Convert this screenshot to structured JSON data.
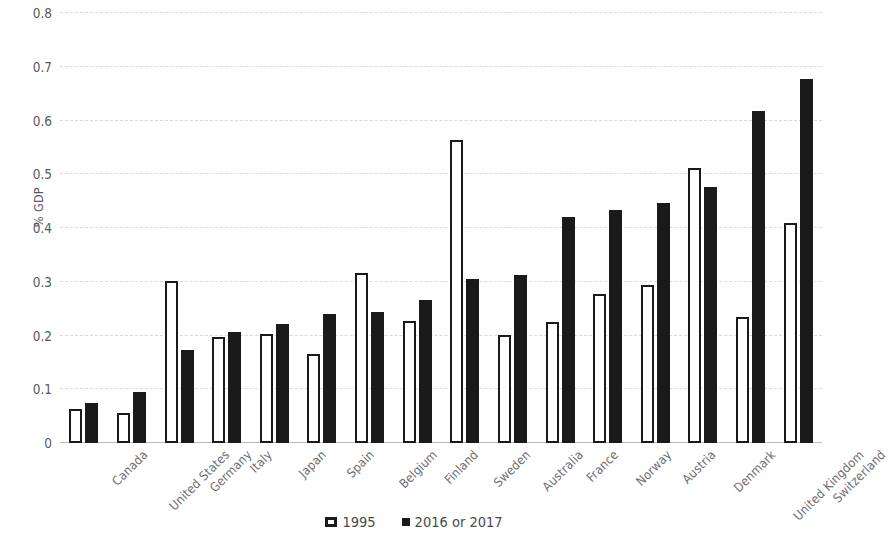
{
  "chart_data": {
    "type": "bar",
    "title": "",
    "xlabel": "",
    "ylabel": "% GDP",
    "ylim": [
      0,
      0.8
    ],
    "ytick_values": [
      0,
      0.1,
      0.2,
      0.3,
      0.4,
      0.5,
      0.6,
      0.7,
      0.8
    ],
    "ytick_labels": [
      "0",
      "0.1",
      "0.2",
      "0.3",
      "0.4",
      "0.5",
      "0.6",
      "0.7",
      "0.8"
    ],
    "grid": true,
    "legend_position": "bottom-center",
    "categories": [
      "Canada",
      "United States",
      "Germany",
      "Italy",
      "Japan",
      "Spain",
      "Belgium",
      "Finland",
      "Sweden",
      "Australia",
      "France",
      "Norway",
      "Austria",
      "Denmark",
      "United Kingdom",
      "Switzerland"
    ],
    "series": [
      {
        "name": "1995",
        "color": "#ffffff",
        "edge_color": "#1a1a1a",
        "values": [
          0.063,
          0.055,
          0.302,
          0.198,
          0.203,
          0.166,
          0.316,
          0.227,
          0.563,
          0.201,
          0.226,
          0.277,
          0.294,
          0.512,
          0.234,
          0.409
        ]
      },
      {
        "name": "2016 or 2017",
        "color": "#1a1a1a",
        "edge_color": "#1a1a1a",
        "values": [
          0.075,
          0.095,
          0.173,
          0.207,
          0.221,
          0.24,
          0.243,
          0.266,
          0.306,
          0.313,
          0.421,
          0.433,
          0.447,
          0.477,
          0.618,
          0.677
        ]
      }
    ]
  },
  "legend": {
    "items": [
      {
        "label": "1995",
        "marker": "open-square-marker"
      },
      {
        "label": "2016 or 2017",
        "marker": "solid-square-marker"
      }
    ]
  },
  "axis": {
    "y_title": "% GDP"
  }
}
